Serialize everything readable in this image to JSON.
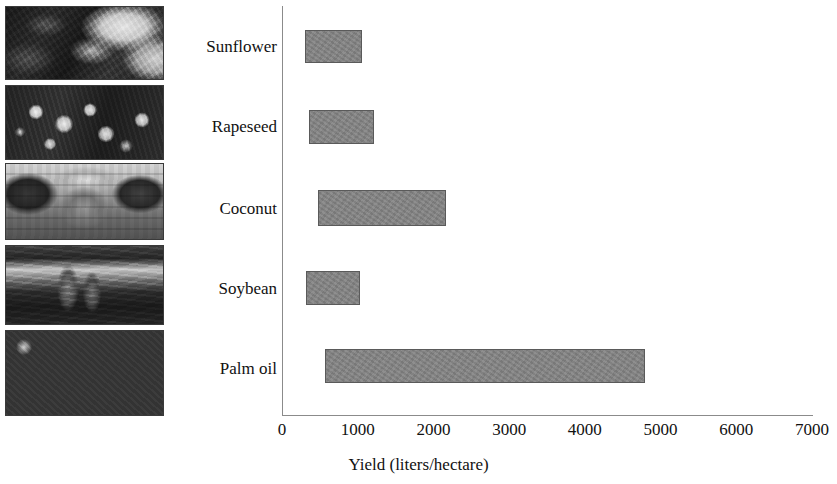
{
  "chart_data": {
    "type": "bar",
    "orientation": "horizontal",
    "title": "",
    "xlabel": "Yield (liters/hectare)",
    "ylabel": "",
    "categories": [
      "Sunflower",
      "Rapeseed",
      "Coconut",
      "Soybean",
      "Palm oil"
    ],
    "bars": [
      {
        "category": "Sunflower",
        "start": 305,
        "end": 1060,
        "value": 1060
      },
      {
        "category": "Rapeseed",
        "start": 360,
        "end": 1215,
        "value": 1215
      },
      {
        "category": "Coconut",
        "start": 480,
        "end": 2165,
        "value": 2165
      },
      {
        "category": "Soybean",
        "start": 320,
        "end": 1030,
        "value": 1030
      },
      {
        "category": "Palm oil",
        "start": 570,
        "end": 4795,
        "value": 4795
      }
    ],
    "values": [
      1060,
      1215,
      2165,
      1030,
      4795
    ],
    "xlim": [
      0,
      7000
    ],
    "xticks": [
      "0",
      "1000",
      "2000",
      "3000",
      "4000",
      "5000",
      "6000",
      "7000"
    ],
    "xtick_values": [
      0,
      1000,
      2000,
      3000,
      4000,
      5000,
      6000,
      7000
    ],
    "grid": false,
    "legend": false,
    "bar_color": "#848484",
    "bar_edge_color": "#5a5a5a",
    "axis_color": "#8b8b8b",
    "text_color": "#111111",
    "background": "#ffffff"
  },
  "photos": [
    {
      "name": "sunflower-photo",
      "caption": "Sunflower"
    },
    {
      "name": "rapeseed-photo",
      "caption": "Rapeseed"
    },
    {
      "name": "coconut-photo",
      "caption": "Coconut"
    },
    {
      "name": "soybean-photo",
      "caption": "Soybean"
    },
    {
      "name": "palm-fruit-photo",
      "caption": "Palm oil"
    }
  ]
}
